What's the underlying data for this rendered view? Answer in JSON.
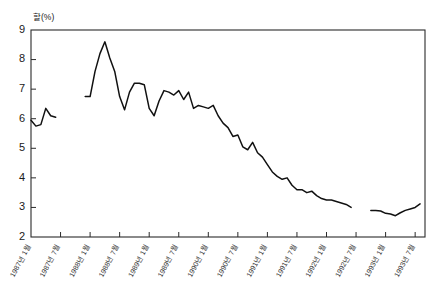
{
  "chart_data": {
    "type": "line",
    "title": "",
    "subtitle": "",
    "xlabel": "",
    "ylabel": "할(%)",
    "unit_note": "할(%)",
    "grid": false,
    "legend": "none",
    "ylim": [
      2,
      9
    ],
    "yticks": [
      "2",
      "3",
      "4",
      "5",
      "6",
      "7",
      "8",
      "9"
    ],
    "ytick_values": [
      2,
      3,
      4,
      5,
      6,
      7,
      8,
      9
    ],
    "categories": [
      "1987년 1월",
      "1987년 7월",
      "1988년 1월",
      "1988년 7월",
      "1989년 1월",
      "1989년 7월",
      "1990년 1월",
      "1990년 7월",
      "1991년 1월",
      "1991년 7월",
      "1992년 1월",
      "1992년 7월",
      "1993년 1월",
      "1993년 7월"
    ],
    "x_tick_positions_months": [
      0,
      6,
      12,
      18,
      24,
      30,
      36,
      42,
      48,
      54,
      60,
      66,
      72,
      78
    ],
    "series": [
      {
        "name": "할(%)",
        "segments": [
          {
            "name": "segment-1",
            "x": [
              0,
              1,
              2,
              3,
              4,
              5
            ],
            "values": [
              5.95,
              5.75,
              5.8,
              6.35,
              6.1,
              6.05
            ]
          },
          {
            "name": "segment-2",
            "x": [
              11,
              12,
              13,
              14,
              15,
              16,
              17,
              18,
              19,
              20,
              21,
              22,
              23,
              24,
              25,
              26,
              27,
              28,
              29,
              30,
              31,
              32,
              33,
              34,
              35,
              36,
              37,
              38,
              39,
              40,
              41,
              42,
              43,
              44,
              45,
              46,
              47,
              48,
              49,
              50,
              51,
              52,
              53,
              54,
              55,
              56,
              57,
              58,
              59,
              60,
              61,
              62,
              63,
              64,
              65
            ],
            "values": [
              6.75,
              6.75,
              7.6,
              8.2,
              8.6,
              8.05,
              7.6,
              6.75,
              6.3,
              6.9,
              7.2,
              7.2,
              7.15,
              6.35,
              6.1,
              6.6,
              6.95,
              6.9,
              6.8,
              6.95,
              6.65,
              6.9,
              6.35,
              6.45,
              6.4,
              6.35,
              6.45,
              6.1,
              5.85,
              5.7,
              5.4,
              5.45,
              5.05,
              4.95,
              5.2,
              4.85,
              4.7,
              4.45,
              4.2,
              4.05,
              3.95,
              4.0,
              3.75,
              3.6,
              3.6,
              3.5,
              3.55,
              3.4,
              3.3,
              3.25,
              3.25,
              3.2,
              3.15,
              3.1,
              3.0
            ]
          },
          {
            "name": "segment-3",
            "x": [
              69,
              70,
              71,
              72,
              73,
              74,
              75,
              76,
              77,
              78,
              79
            ],
            "values": [
              2.9,
              2.9,
              2.88,
              2.8,
              2.78,
              2.72,
              2.82,
              2.9,
              2.95,
              3.0,
              3.12
            ]
          }
        ]
      }
    ]
  }
}
